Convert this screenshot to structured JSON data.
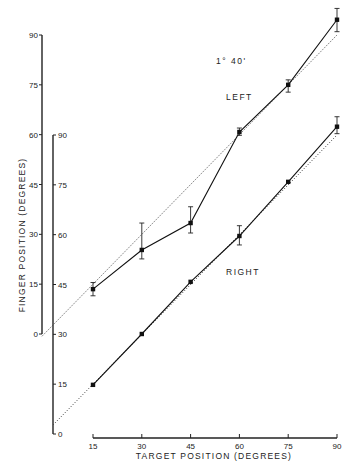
{
  "chart_data": {
    "type": "line",
    "title": "",
    "xlabel": "TARGET POSITION (DEGREES)",
    "ylabel": "FINGER POSITION (DEGREES)",
    "x": [
      15,
      30,
      45,
      60,
      75,
      90
    ],
    "xlim": [
      15,
      90
    ],
    "x_ticks": [
      15,
      30,
      45,
      60,
      75,
      90
    ],
    "grid": false,
    "legend": "none (inline labels)",
    "axes": [
      {
        "name": "left-axis",
        "series": "LEFT",
        "ylim": [
          0,
          90
        ],
        "ticks": [
          0,
          15,
          30,
          45,
          60,
          75,
          90
        ]
      },
      {
        "name": "right-axis",
        "series": "RIGHT",
        "ylim": [
          0,
          90
        ],
        "ticks": [
          0,
          15,
          30,
          45,
          60,
          75,
          90
        ]
      }
    ],
    "series": [
      {
        "name": "LEFT",
        "axis": "left-axis",
        "values": [
          13.5,
          25.3,
          33.4,
          60.8,
          75.0,
          94.6
        ],
        "error_low": [
          11.5,
          22.6,
          30.4,
          59.8,
          72.8,
          91.0
        ],
        "error_high": [
          15.5,
          33.4,
          38.3,
          62.0,
          76.5,
          98.0
        ]
      },
      {
        "name": "RIGHT",
        "axis": "right-axis",
        "values": [
          14.8,
          30.1,
          45.8,
          59.6,
          75.9,
          92.5
        ],
        "error_low": [
          14.8,
          30.1,
          45.8,
          56.9,
          75.9,
          90.4
        ],
        "error_high": [
          14.8,
          30.1,
          45.8,
          62.7,
          75.9,
          95.5
        ]
      }
    ],
    "reference_lines": [
      {
        "name": "left-identity",
        "style": "dotted",
        "axis": "left-axis",
        "from": [
          15,
          15
        ],
        "to": [
          90,
          90
        ]
      },
      {
        "name": "right-identity",
        "style": "dotted",
        "axis": "right-axis",
        "from": [
          15,
          15
        ],
        "to": [
          90,
          90
        ]
      }
    ],
    "annotations": [
      "1° 40'",
      "LEFT",
      "RIGHT"
    ]
  },
  "labels": {
    "xlabel": "TARGET POSITION (DEGREES)",
    "ylabel": "FINGER POSITION (DEGREES)",
    "annotation_angle": "1° 40'",
    "left_label": "LEFT",
    "right_label": "RIGHT"
  }
}
